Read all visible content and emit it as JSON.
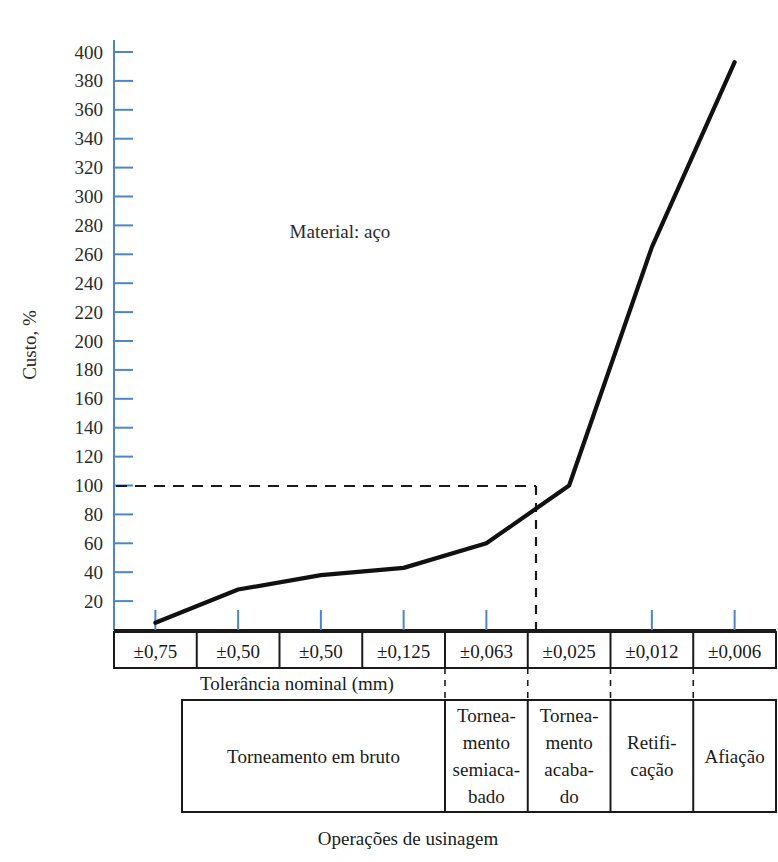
{
  "figure": {
    "annotation": "Material: aço",
    "y_axis_title": "Custo, %",
    "tolerance_row_label": "Tolerância nominal (mm)",
    "caption": "Operações de usinagem",
    "line_color": "#111111",
    "axis_color": "#4a86c8",
    "table_border_color": "#1a1a1a",
    "dash_color": "#1a1a1a"
  },
  "chart_data": {
    "type": "line",
    "title": "",
    "subtitle": "",
    "annotations": [
      "Material: aço"
    ],
    "xlabel": "Tolerância nominal (mm)",
    "ylabel": "Custo, %",
    "xlabel2": "Operações de usinagem",
    "ylim": [
      0,
      400
    ],
    "ytick_step": 20,
    "grid": false,
    "legend": "none",
    "yticks": [
      400,
      380,
      360,
      340,
      320,
      300,
      280,
      260,
      240,
      220,
      200,
      180,
      160,
      140,
      120,
      100,
      80,
      60,
      40,
      20
    ],
    "categories": [
      "±0,75",
      "±0,50",
      "±0,50",
      "±0,125",
      "±0,063",
      "±0,025",
      "±0,012",
      "±0,006"
    ],
    "x_index": [
      0,
      1,
      2,
      3,
      4,
      5,
      6,
      7
    ],
    "values": [
      5,
      28,
      38,
      43,
      60,
      100,
      265,
      393
    ],
    "series": [
      {
        "name": "Custo relativo de usinagem (aço)",
        "values": [
          5,
          28,
          38,
          43,
          60,
          100,
          265,
          393
        ]
      }
    ],
    "reference_lines": [
      {
        "orientation": "horizontal",
        "value": 100,
        "style": "dashed"
      },
      {
        "orientation": "vertical",
        "category": "±0,025",
        "style": "dashed"
      }
    ]
  },
  "tolerance_cells": [
    {
      "label": "±0,75"
    },
    {
      "label": "±0,50"
    },
    {
      "label": "±0,50"
    },
    {
      "label": "±0,125"
    },
    {
      "label": "±0,063"
    },
    {
      "label": "±0,025"
    },
    {
      "label": "±0,012"
    },
    {
      "label": "±0,006"
    }
  ],
  "operations": [
    {
      "lines": [
        "Torneamento em bruto"
      ],
      "span": 4
    },
    {
      "lines": [
        "Tornea-",
        "mento",
        "semiaca-",
        "bado"
      ],
      "span": 1
    },
    {
      "lines": [
        "Tornea-",
        "mento",
        "acaba-",
        "do"
      ],
      "span": 1
    },
    {
      "lines": [
        "Retifi-",
        "cação"
      ],
      "span": 1
    },
    {
      "lines": [
        "Afiação"
      ],
      "span": 1
    }
  ]
}
